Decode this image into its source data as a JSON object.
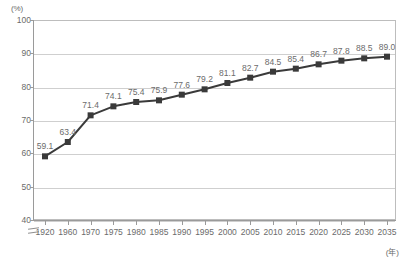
{
  "chart_data": {
    "type": "line",
    "title": "",
    "xlabel": "(年)",
    "ylabel": "(%)",
    "categories": [
      "1920",
      "1960",
      "1970",
      "1975",
      "1980",
      "1985",
      "1990",
      "1995",
      "2000",
      "2005",
      "2010",
      "2015",
      "2020",
      "2025",
      "2030",
      "2035"
    ],
    "values": [
      59.1,
      63.4,
      71.4,
      74.1,
      75.4,
      75.9,
      77.6,
      79.2,
      81.1,
      82.7,
      84.5,
      85.4,
      86.7,
      87.8,
      88.5,
      89.0
    ],
    "point_labels": [
      "59.1",
      "63.4",
      "71.4",
      "74.1",
      "75.4",
      "75.9",
      "77.6",
      "79.2",
      "81.1",
      "82.7",
      "84.5",
      "85.4",
      "86.7",
      "87.8",
      "88.5",
      "89.0"
    ],
    "ylim": [
      40,
      100
    ],
    "yticks": [
      40,
      50,
      60,
      70,
      80,
      90,
      100
    ],
    "ytick_labels": [
      "40",
      "50",
      "60",
      "70",
      "80",
      "90",
      "100"
    ],
    "grid": true,
    "grid_axis": "y",
    "legend": false,
    "axis_break": true,
    "series_color": "#3a3a3a",
    "grid_color": "#cfcfcf",
    "axis_color": "#9a9a9a",
    "label_color": "#6b6b6b",
    "marker": "square"
  }
}
